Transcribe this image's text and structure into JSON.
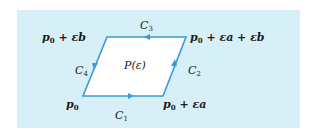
{
  "diagram": {
    "region_label": "P(ε)",
    "vertices": {
      "p0": {
        "base": "p",
        "sub": "0",
        "rest": ""
      },
      "p0_ea": {
        "base": "p",
        "sub": "0",
        "rest": " + εa"
      },
      "p0_ea_eb": {
        "base": "p",
        "sub": "0",
        "rest": " + εa + εb"
      },
      "p0_eb": {
        "base": "p",
        "sub": "0",
        "rest": " + εb"
      }
    },
    "curves": {
      "c1": {
        "base": "C",
        "sub": "1"
      },
      "c2": {
        "base": "C",
        "sub": "2"
      },
      "c3": {
        "base": "C",
        "sub": "3"
      },
      "c4": {
        "base": "C",
        "sub": "4"
      }
    },
    "colors": {
      "background": "#d7f0f8",
      "line": "#3a9ad9",
      "fill": "#ffffff"
    }
  }
}
